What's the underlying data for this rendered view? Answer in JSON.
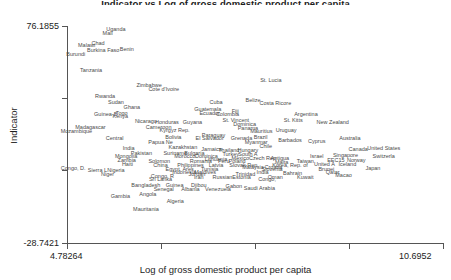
{
  "chart_data": {
    "type": "scatter",
    "title": "Indicator vs Log of gross domestic product per capita",
    "xlabel": "Log of gross domestic product per capita",
    "ylabel": "Indicator",
    "grid": false,
    "legend": null,
    "xlim": [
      4.78264,
      10.6952
    ],
    "ylim": [
      -28.7421,
      76.1855
    ],
    "xticks": [
      "4.78264",
      "",
      "",
      "",
      "10.6952"
    ],
    "yticks": [
      "76.1855",
      "",
      "",
      "-28.7421"
    ],
    "point_style": "text-labels-only",
    "points": [
      {
        "label": "Uganda",
        "x": 5.55,
        "y": 74.9
      },
      {
        "label": "Mali",
        "x": 5.42,
        "y": 72.6
      },
      {
        "label": "Chad",
        "x": 5.27,
        "y": 68.1
      },
      {
        "label": "Malawi",
        "x": 5.09,
        "y": 66.9
      },
      {
        "label": "Burkina Faso",
        "x": 5.35,
        "y": 64.5
      },
      {
        "label": "Benin",
        "x": 5.72,
        "y": 65.1
      },
      {
        "label": "Burundi",
        "x": 4.92,
        "y": 62.6
      },
      {
        "label": "Tanzania",
        "x": 5.16,
        "y": 55.1
      },
      {
        "label": "Zimbabwe",
        "x": 6.07,
        "y": 47.6
      },
      {
        "label": "Cote d'Ivoire",
        "x": 6.3,
        "y": 45.7
      },
      {
        "label": "St. Lucia",
        "x": 7.98,
        "y": 50.3
      },
      {
        "label": "Rwanda",
        "x": 5.38,
        "y": 42.2
      },
      {
        "label": "Sudan",
        "x": 5.55,
        "y": 39.3
      },
      {
        "label": "Ghana",
        "x": 5.8,
        "y": 37.1
      },
      {
        "label": "Cuba",
        "x": 7.12,
        "y": 39.2
      },
      {
        "label": "Belize",
        "x": 7.7,
        "y": 40.5
      },
      {
        "label": "Costa Ricore",
        "x": 8.05,
        "y": 39.0
      },
      {
        "label": "Guatemala",
        "x": 6.99,
        "y": 36.0
      },
      {
        "label": "Ecuador",
        "x": 7.02,
        "y": 34.2
      },
      {
        "label": "Fiji",
        "x": 7.42,
        "y": 35.3
      },
      {
        "label": "Colombia",
        "x": 7.3,
        "y": 33.6
      },
      {
        "label": "Togo",
        "x": 5.64,
        "y": 34.3
      },
      {
        "label": "Guinea-B",
        "x": 5.39,
        "y": 33.7
      },
      {
        "label": "Kenya",
        "x": 5.62,
        "y": 32.8
      },
      {
        "label": "Argentina",
        "x": 8.53,
        "y": 33.6
      },
      {
        "label": "Nicaragu",
        "x": 6.02,
        "y": 30.3
      },
      {
        "label": "Honduras",
        "x": 6.35,
        "y": 30.0
      },
      {
        "label": "Guyana",
        "x": 6.75,
        "y": 29.6
      },
      {
        "label": "St. Vincent",
        "x": 7.43,
        "y": 30.6
      },
      {
        "label": "Dominica",
        "x": 7.57,
        "y": 29.0
      },
      {
        "label": "St. Kitts",
        "x": 8.33,
        "y": 30.8
      },
      {
        "label": "New Zealand",
        "x": 8.95,
        "y": 29.6
      },
      {
        "label": "Madagascar",
        "x": 5.15,
        "y": 27.4
      },
      {
        "label": "Cameroon",
        "x": 6.22,
        "y": 27.3
      },
      {
        "label": "Mozambique",
        "x": 4.93,
        "y": 25.5
      },
      {
        "label": "Kyrgyz Rep.",
        "x": 6.47,
        "y": 25.9
      },
      {
        "label": "Panama",
        "x": 7.62,
        "y": 26.8
      },
      {
        "label": "Mauritius",
        "x": 7.83,
        "y": 25.5
      },
      {
        "label": "Uruguay",
        "x": 8.22,
        "y": 25.7
      },
      {
        "label": "Central",
        "x": 5.53,
        "y": 21.9
      },
      {
        "label": "Bolivia",
        "x": 6.45,
        "y": 22.7
      },
      {
        "label": "Paraguay",
        "x": 7.08,
        "y": 23.3
      },
      {
        "label": "El Salvador",
        "x": 7.02,
        "y": 22.2
      },
      {
        "label": "Grenada",
        "x": 7.52,
        "y": 22.0
      },
      {
        "label": "Brazil",
        "x": 7.82,
        "y": 22.3
      },
      {
        "label": "Barbados",
        "x": 8.28,
        "y": 21.0
      },
      {
        "label": "Cyprus",
        "x": 8.7,
        "y": 20.5
      },
      {
        "label": "Australia",
        "x": 9.22,
        "y": 22.2
      },
      {
        "label": "Papua Ne",
        "x": 6.25,
        "y": 20.1
      },
      {
        "label": "Myanmar",
        "x": 7.75,
        "y": 19.9
      },
      {
        "label": "Chile",
        "x": 7.9,
        "y": 18.1
      },
      {
        "label": "India",
        "x": 5.75,
        "y": 17.0
      },
      {
        "label": "Kazakhstan",
        "x": 6.6,
        "y": 17.7
      },
      {
        "label": "Jamaica",
        "x": 7.05,
        "y": 16.5
      },
      {
        "label": "Thailand",
        "x": 7.32,
        "y": 16.3
      },
      {
        "label": "Hungary",
        "x": 7.62,
        "y": 16.4
      },
      {
        "label": "Pakistan",
        "x": 5.95,
        "y": 15.0
      },
      {
        "label": "Suriname",
        "x": 6.48,
        "y": 14.9
      },
      {
        "label": "Bulgaria",
        "x": 6.78,
        "y": 14.9
      },
      {
        "label": "Turkey",
        "x": 7.35,
        "y": 14.4
      },
      {
        "label": "South A",
        "x": 7.62,
        "y": 14.2
      },
      {
        "label": "Canada",
        "x": 9.35,
        "y": 16.6
      },
      {
        "label": "United States",
        "x": 9.75,
        "y": 17.2
      },
      {
        "label": "Mongolia",
        "x": 5.71,
        "y": 13.4
      },
      {
        "label": "Morocco",
        "x": 6.63,
        "y": 13.1
      },
      {
        "label": "Dominica",
        "x": 6.97,
        "y": 13.4
      },
      {
        "label": "Lithuania",
        "x": 7.12,
        "y": 12.1
      },
      {
        "label": "Mexico",
        "x": 7.5,
        "y": 12.6
      },
      {
        "label": "Czech Rep",
        "x": 7.85,
        "y": 12.5
      },
      {
        "label": "Antigua",
        "x": 8.12,
        "y": 12.3
      },
      {
        "label": "Israel",
        "x": 8.7,
        "y": 13.1
      },
      {
        "label": "Singapore",
        "x": 9.15,
        "y": 13.7
      },
      {
        "label": "Switzerla",
        "x": 9.75,
        "y": 13.2
      },
      {
        "label": "Zambia",
        "x": 5.72,
        "y": 11.4
      },
      {
        "label": "Solomon",
        "x": 6.23,
        "y": 11.1
      },
      {
        "label": "Romania",
        "x": 6.88,
        "y": 10.8
      },
      {
        "label": "Peru",
        "x": 7.24,
        "y": 11.0
      },
      {
        "label": "Poland",
        "x": 7.45,
        "y": 10.7
      },
      {
        "label": "Malta",
        "x": 8.15,
        "y": 10.4
      },
      {
        "label": "Taiwan",
        "x": 8.52,
        "y": 11.0
      },
      {
        "label": "EEC15",
        "x": 9.0,
        "y": 11.2
      },
      {
        "label": "Norway",
        "x": 9.32,
        "y": 11.2
      },
      {
        "label": "Haiti",
        "x": 5.73,
        "y": 9.3
      },
      {
        "label": "China",
        "x": 6.25,
        "y": 9.0
      },
      {
        "label": "Philippines",
        "x": 6.72,
        "y": 9.0
      },
      {
        "label": "Latvia",
        "x": 7.12,
        "y": 9.0
      },
      {
        "label": "Slovak Rep.",
        "x": 7.56,
        "y": 9.1
      },
      {
        "label": "Malaysia",
        "x": 7.7,
        "y": 8.0
      },
      {
        "label": "Korea, Rep. of",
        "x": 8.28,
        "y": 9.2
      },
      {
        "label": "United A",
        "x": 8.82,
        "y": 9.3
      },
      {
        "label": "Iceland",
        "x": 9.18,
        "y": 9.3
      },
      {
        "label": "Croatia",
        "x": 8.02,
        "y": 8.2
      },
      {
        "label": "Congo, D.",
        "x": 4.88,
        "y": 7.5
      },
      {
        "label": "Sierra L",
        "x": 5.26,
        "y": 6.5
      },
      {
        "label": "Nigeria",
        "x": 5.55,
        "y": 6.7
      },
      {
        "label": "Egypt, Ares",
        "x": 6.55,
        "y": 7.2
      },
      {
        "label": "Tunisia",
        "x": 7.02,
        "y": 7.0
      },
      {
        "label": "Slovenia",
        "x": 8.0,
        "y": 7.1
      },
      {
        "label": "Brunei",
        "x": 8.85,
        "y": 7.2
      },
      {
        "label": "Japan",
        "x": 9.58,
        "y": 7.3
      },
      {
        "label": "Indonesia",
        "x": 6.62,
        "y": 5.4
      },
      {
        "label": "Maldives",
        "x": 6.95,
        "y": 5.6
      },
      {
        "label": "Trinidad",
        "x": 7.58,
        "y": 4.6
      },
      {
        "label": "Bahrain",
        "x": 8.32,
        "y": 5.2
      },
      {
        "label": "Qatar",
        "x": 8.95,
        "y": 5.4
      },
      {
        "label": "Macao",
        "x": 9.12,
        "y": 4.3
      },
      {
        "label": "Niger",
        "x": 5.42,
        "y": 4.6
      },
      {
        "label": "Jordan",
        "x": 6.82,
        "y": 4.4
      },
      {
        "label": "India",
        "x": 7.85,
        "y": 5.7
      },
      {
        "label": "Congo, R",
        "x": 6.28,
        "y": 3.5
      },
      {
        "label": "Iran",
        "x": 6.85,
        "y": 3.2
      },
      {
        "label": "Russian",
        "x": 7.22,
        "y": 3.4
      },
      {
        "label": "Estonia",
        "x": 7.52,
        "y": 3.3
      },
      {
        "label": "Oman",
        "x": 8.05,
        "y": 3.4
      },
      {
        "label": "Kuwait",
        "x": 8.52,
        "y": 3.3
      },
      {
        "label": "Sri Lanka",
        "x": 6.25,
        "y": 2.1
      },
      {
        "label": "Congo,",
        "x": 7.92,
        "y": 2.0
      },
      {
        "label": "Bangladesh",
        "x": 6.02,
        "y": -0.8
      },
      {
        "label": "Guinea",
        "x": 6.47,
        "y": -0.7
      },
      {
        "label": "Djibou",
        "x": 6.85,
        "y": -0.6
      },
      {
        "label": "Gabon",
        "x": 7.4,
        "y": -1.1
      },
      {
        "label": "Venezuela",
        "x": 7.15,
        "y": -2.6
      },
      {
        "label": "Saudi Arabia",
        "x": 7.8,
        "y": -2.3
      },
      {
        "label": "Senegal",
        "x": 6.3,
        "y": -2.6
      },
      {
        "label": "Albania",
        "x": 6.72,
        "y": -2.7
      },
      {
        "label": "Angola",
        "x": 6.05,
        "y": -5.0
      },
      {
        "label": "Gambia",
        "x": 5.62,
        "y": -6.0
      },
      {
        "label": "Algeria",
        "x": 6.48,
        "y": -8.3
      },
      {
        "label": "Mauritania",
        "x": 6.02,
        "y": -12.2
      }
    ]
  },
  "axes": {
    "x_title": "Log of gross domestic product per capita",
    "y_title": "Indicator",
    "x_tick_min": "4.78264",
    "x_tick_max": "10.6952",
    "y_tick_max": "76.1855",
    "y_tick_min": "-28.7421"
  },
  "header": {
    "title_clipped": "Indicator vs Log of gross domestic product per capita"
  },
  "colors": {
    "background": "#ffffff",
    "axis": "#555555",
    "label_text": "#4a4a4a",
    "tick_text": "#222222"
  }
}
